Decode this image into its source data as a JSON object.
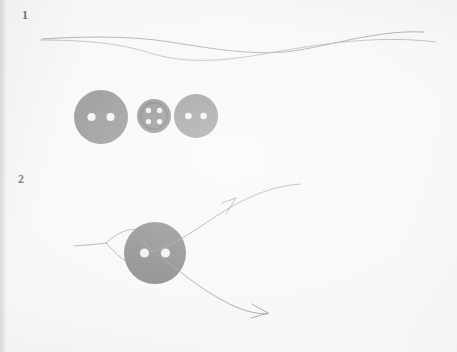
{
  "document": {
    "kind": "handwritten-sewing-diagram",
    "background_color": "#f7f6f4",
    "ink_color": "#8e8c8a",
    "width": 457,
    "height": 352
  },
  "steps": [
    {
      "number": "1",
      "label_x": 22,
      "label_y": 8,
      "description": "Thread lines drawn above a row of three buttons"
    },
    {
      "number": "2",
      "label_x": 18,
      "label_y": 172,
      "description": "Thread passing through a two-hole button with directional arrows"
    }
  ],
  "buttons": [
    {
      "name": "large-two-hole-button",
      "cx": 101,
      "cy": 117,
      "r": 27,
      "fill": "#757371",
      "rim": false,
      "holes": 2,
      "hole_r": 4.1,
      "hole_fill": "#f2f0ee",
      "hole_offset": 9.5
    },
    {
      "name": "small-four-hole-button",
      "cx": 154,
      "cy": 116,
      "r": 17,
      "fill": "#6e6c6a",
      "rim": true,
      "rim_r": 13.2,
      "rim_color": "#4f4d4b",
      "holes": 4,
      "hole_r": 2.7,
      "hole_fill": "#f2f0ee",
      "hole_offset": 5.6
    },
    {
      "name": "medium-two-hole-button",
      "cx": 196,
      "cy": 116,
      "r": 22,
      "fill": "#797775",
      "rim": false,
      "holes": 2,
      "hole_r": 3.3,
      "hole_fill": "#f0eeec",
      "hole_offset": 7.6
    },
    {
      "name": "threaded-two-hole-button",
      "cx": 155,
      "cy": 253,
      "r": 31,
      "fill": "#6f6d6b",
      "rim": false,
      "holes": 2,
      "hole_r": 4.6,
      "hole_fill": "#efedeb",
      "hole_offset": 10.5
    }
  ],
  "threads": {
    "step1_upper": "M 42,39 C 90,36 132,36 170,42 C 215,49 258,57 300,50 C 344,42 382,30 424,32",
    "step1_lower": "M 40,40 C 82,40 120,43 150,53 C 182,63 216,62 258,55 C 310,46 372,34 436,42",
    "step2_tail": "M 74,246 C 88,245 98,244 106,243",
    "step2_loop_upper": "M 106,243 C 118,232 128,228 140,230 C 152,233 160,240 166,247",
    "step2_loop_lower": "M 106,243 C 116,254 126,264 140,268 C 152,271 161,266 168,258",
    "step2_out_upper": "M 152,252 C 178,244 200,226 226,210 C 252,194 276,186 300,184",
    "step2_out_lower": "M 160,256 C 180,272 200,288 222,300 C 240,310 254,314 268,314",
    "step2_hole_link": "M 143,240 C 146,245 149,249 152,252",
    "arrow_upper_head": "M 222,203 L 236,198 M 226,214 L 236,198",
    "arrow_lower_head": "M 252,304 L 268,313 M 251,318 L 268,313"
  }
}
